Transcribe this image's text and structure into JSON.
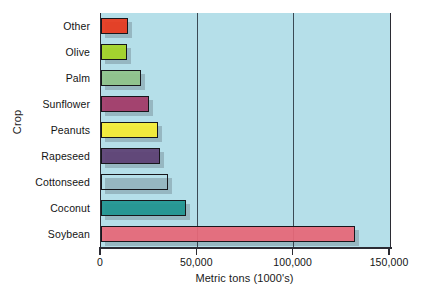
{
  "chart_data": {
    "type": "bar",
    "orientation": "horizontal",
    "title": "",
    "xlabel": "Metric tons (1000's)",
    "ylabel": "Crop",
    "xlim": [
      0,
      150000
    ],
    "xticks": [
      0,
      50000,
      100000,
      150000
    ],
    "xtick_labels": [
      "0",
      "50,000",
      "100,000",
      "150,000"
    ],
    "grid": "vertical",
    "legend": "none",
    "plot_background": "#b5dfe9",
    "categories": [
      "Soybean",
      "Coconut",
      "Cottonseed",
      "Rapeseed",
      "Peanuts",
      "Sunflower",
      "Palm",
      "Olive",
      "Other"
    ],
    "values": [
      132000,
      44000,
      35000,
      30500,
      29500,
      25000,
      21000,
      13500,
      14000
    ],
    "bars": [
      {
        "category": "Other",
        "value": 14000,
        "color": "#e8381c"
      },
      {
        "category": "Olive",
        "value": 13500,
        "color": "#a4d423"
      },
      {
        "category": "Palm",
        "value": 21000,
        "color": "#8fc48a"
      },
      {
        "category": "Sunflower",
        "value": 25000,
        "color": "#a43a68"
      },
      {
        "category": "Peanuts",
        "value": 29500,
        "color": "#f7ee33"
      },
      {
        "category": "Rapeseed",
        "value": 30500,
        "color": "#5c3f73"
      },
      {
        "category": "Cottonseed",
        "value": 35000,
        "color": "#e2a košice"
      },
      {
        "category": "Coconut",
        "value": 44000,
        "color": "#1f9490"
      },
      {
        "category": "Soybean",
        "value": 132000,
        "color": "#e8697a"
      }
    ]
  }
}
